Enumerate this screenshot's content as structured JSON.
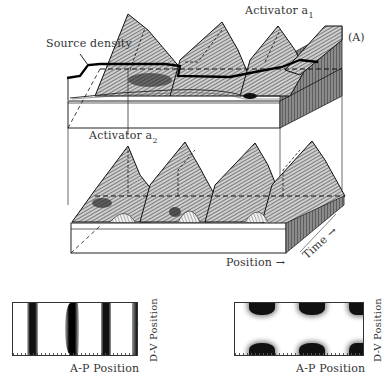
{
  "figure": {
    "panel_a": {
      "tag": "(A)",
      "labels": {
        "activator_1": "Activator a",
        "activator_1_sub": "1",
        "activator_2": "Activator a",
        "activator_2_sub": "2",
        "source_density": "Source density",
        "position_axis": "Position →",
        "time_axis": "Time →"
      },
      "peaks_per_surface": 4
    },
    "panel_b": {
      "tag": "(B)",
      "x_label": "A-P Position",
      "y_label": "D-V Position",
      "pattern": "vertical stripes",
      "stripe_x_fraction": [
        0.17,
        0.47,
        0.75,
        0.98
      ]
    },
    "panel_c": {
      "tag": "(C)",
      "x_label": "A-P Position",
      "y_label": "D-V Position",
      "pattern": "alternating dorsal/ventral patches",
      "patch_x_fraction": [
        0.2,
        0.57,
        0.97
      ]
    }
  }
}
